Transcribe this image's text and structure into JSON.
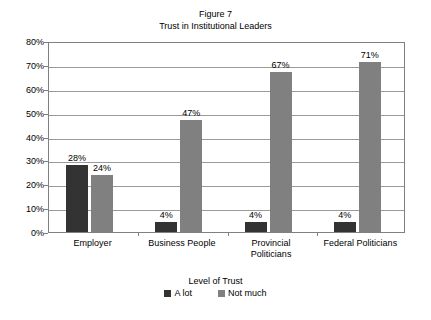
{
  "chart_data": {
    "type": "bar",
    "title": "Figure 7",
    "subtitle": "Trust in Institutional Leaders",
    "xlabel": "",
    "ylabel": "",
    "ylim": [
      0,
      80
    ],
    "ytick_labels": [
      "80%",
      "70%",
      "60%",
      "50%",
      "40%",
      "30%",
      "20%",
      "10%",
      "0%"
    ],
    "ytick_values": [
      80,
      70,
      60,
      50,
      40,
      30,
      20,
      10,
      0
    ],
    "grid": true,
    "legend_title": "Level of Trust",
    "legend_position": "bottom",
    "categories": [
      "Employer",
      "Business People",
      "Provincial Politicians",
      "Federal Politicians"
    ],
    "category_lines": [
      [
        "Employer"
      ],
      [
        "Business People"
      ],
      [
        "Provincial",
        "Politicians"
      ],
      [
        "Federal Politicians"
      ]
    ],
    "series": [
      {
        "name": "A lot",
        "color": "#333333",
        "values": [
          28,
          4,
          4,
          4
        ],
        "labels": [
          "28%",
          "4%",
          "4%",
          "4%"
        ]
      },
      {
        "name": "Not much",
        "color": "#808080",
        "values": [
          24,
          47,
          67,
          71
        ],
        "labels": [
          "24%",
          "47%",
          "67%",
          "71%"
        ]
      }
    ]
  }
}
